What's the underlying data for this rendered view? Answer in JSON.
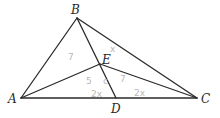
{
  "diagram": {
    "type": "geometry-triangle",
    "points": {
      "A": {
        "label": "A",
        "x": 21,
        "y": 98,
        "lx": 8,
        "ly": 103
      },
      "B": {
        "label": "B",
        "x": 77,
        "y": 18,
        "lx": 71,
        "ly": 14
      },
      "C": {
        "label": "C",
        "x": 197,
        "y": 98,
        "lx": 201,
        "ly": 103
      },
      "D": {
        "label": "D",
        "x": 116,
        "y": 98,
        "lx": 111,
        "ly": 113
      },
      "E": {
        "label": "E",
        "x": 100,
        "y": 64,
        "lx": 102,
        "ly": 64
      }
    },
    "segments": [
      [
        "A",
        "B"
      ],
      [
        "B",
        "C"
      ],
      [
        "A",
        "C"
      ],
      [
        "B",
        "D"
      ],
      [
        "A",
        "E"
      ],
      [
        "E",
        "C"
      ]
    ],
    "annotations": [
      {
        "text": "7",
        "x": 68,
        "y": 60
      },
      {
        "text": "x",
        "x": 110,
        "y": 52
      },
      {
        "text": "5",
        "x": 86,
        "y": 84
      },
      {
        "text": "c",
        "x": 103,
        "y": 84
      },
      {
        "text": "7",
        "x": 120,
        "y": 82
      },
      {
        "text": "2x",
        "x": 91,
        "y": 97
      },
      {
        "text": "2x",
        "x": 134,
        "y": 96
      }
    ],
    "colors": {
      "line": "#2a2a2a",
      "pencil": "#b8b8b8"
    }
  }
}
